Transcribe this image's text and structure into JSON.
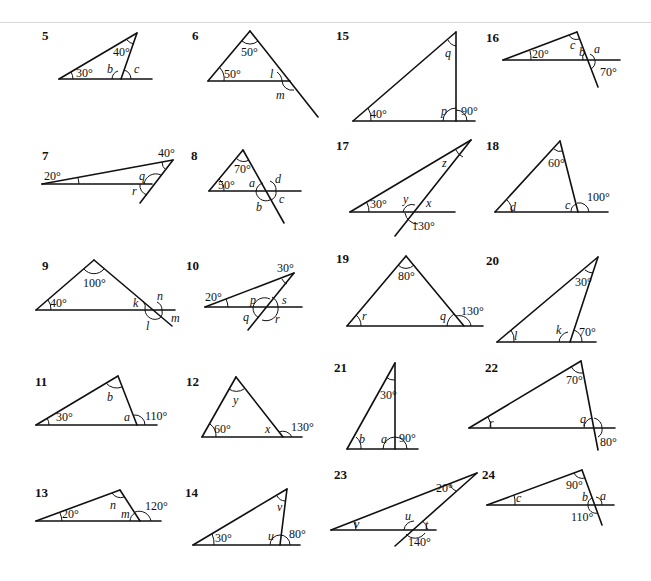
{
  "problems": [
    {
      "number": "5",
      "labels": [
        "30°",
        "40°",
        "b",
        "c"
      ]
    },
    {
      "number": "6",
      "labels": [
        "50°",
        "50°",
        "l",
        "m"
      ]
    },
    {
      "number": "7",
      "labels": [
        "20°",
        "40°",
        "q",
        "r"
      ]
    },
    {
      "number": "8",
      "labels": [
        "70°",
        "50°",
        "a",
        "d",
        "b",
        "c"
      ]
    },
    {
      "number": "9",
      "labels": [
        "100°",
        "40°",
        "k",
        "n",
        "l",
        "m"
      ]
    },
    {
      "number": "10",
      "labels": [
        "30°",
        "20°",
        "p",
        "s",
        "q",
        "r"
      ]
    },
    {
      "number": "11",
      "labels": [
        "b",
        "30°",
        "a",
        "110°"
      ]
    },
    {
      "number": "12",
      "labels": [
        "y",
        "60°",
        "x",
        "130°"
      ]
    },
    {
      "number": "13",
      "labels": [
        "n",
        "20°",
        "m",
        "120°"
      ]
    },
    {
      "number": "14",
      "labels": [
        "v",
        "30°",
        "u",
        "80°"
      ]
    },
    {
      "number": "15",
      "labels": [
        "q",
        "40°",
        "p",
        "90°"
      ]
    },
    {
      "number": "16",
      "labels": [
        "c",
        "20°",
        "b",
        "a",
        "70°"
      ]
    },
    {
      "number": "17",
      "labels": [
        "z",
        "30°",
        "y",
        "x",
        "130°"
      ]
    },
    {
      "number": "18",
      "labels": [
        "60°",
        "d",
        "c",
        "100°"
      ]
    },
    {
      "number": "19",
      "labels": [
        "80°",
        "r",
        "q",
        "130°"
      ]
    },
    {
      "number": "20",
      "labels": [
        "30°",
        "l",
        "k",
        "70°"
      ]
    },
    {
      "number": "21",
      "labels": [
        "30°",
        "b",
        "a",
        "90°"
      ]
    },
    {
      "number": "22",
      "labels": [
        "70°",
        "r",
        "q",
        "80°"
      ]
    },
    {
      "number": "23",
      "labels": [
        "20°",
        "v",
        "u",
        "t",
        "140°"
      ]
    },
    {
      "number": "24",
      "labels": [
        "90°",
        "c",
        "b",
        "a",
        "110°"
      ]
    }
  ]
}
